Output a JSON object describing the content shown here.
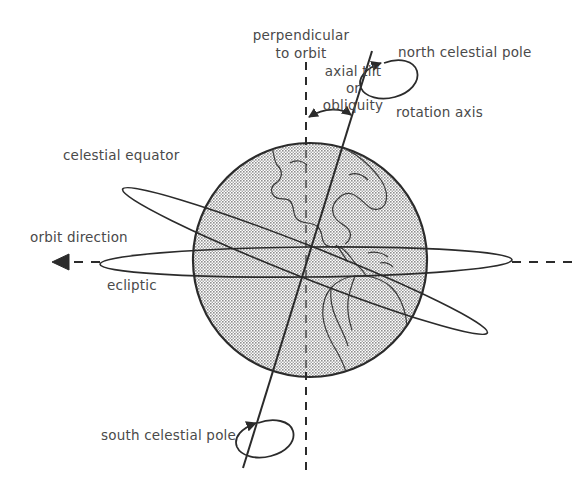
{
  "figure": {
    "background_color": "#ffffff",
    "line_color": "#2b2b2b",
    "text_color": "#4a4a4a",
    "globe_fill_color": "#b0b0b0"
  },
  "labels": {
    "perpendicular_line1": "perpendicular",
    "perpendicular_line2": "to orbit",
    "axial_tilt_line1": "axial tilt",
    "axial_tilt_line2": "or",
    "axial_tilt_line3": "obliquity",
    "north_celestial_pole": "north celestial pole",
    "rotation_axis": "rotation axis",
    "celestial_equator": "celestial equator",
    "orbit_direction": "orbit direction",
    "ecliptic": "ecliptic",
    "south_celestial_pole": "south celestial pole"
  },
  "geometry": {
    "globe_center_x": 310,
    "globe_center_y": 260,
    "globe_radius": 117,
    "axis_top_x": 372,
    "axis_top_y": 51,
    "axis_bottom_x": 243,
    "axis_bottom_y": 468,
    "perpendicular_x": 306,
    "ecliptic_left_tip_x": 100,
    "ecliptic_right_tip_x": 512,
    "ecliptic_y": 262,
    "celestial_equator_left_tip_x": 113,
    "celestial_equator_left_tip_y": 180,
    "celestial_equator_right_tip_x": 497,
    "celestial_equator_right_tip_y": 342,
    "axial_tilt_degrees": 23.5
  }
}
